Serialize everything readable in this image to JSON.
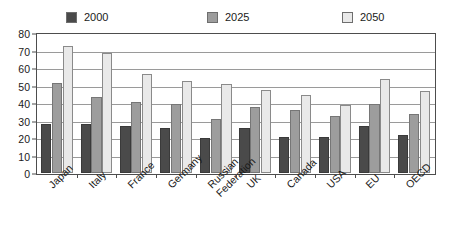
{
  "chart_data": {
    "type": "bar",
    "title": "",
    "subtitle": "",
    "xlabel": "",
    "ylabel": "",
    "ylim": [
      0,
      80
    ],
    "ytick_step": 10,
    "yticks": [
      80,
      70,
      60,
      50,
      40,
      30,
      20,
      10,
      0
    ],
    "grid": true,
    "grid_axis": "y",
    "legend_position": "top",
    "categories": [
      "Japan",
      "Italy",
      "France",
      "Germany",
      "Russian Federation",
      "UK",
      "Canada",
      "USA",
      "EU",
      "OECD"
    ],
    "series": [
      {
        "name": "2000",
        "color": "#4a4a4a",
        "values": [
          28,
          28,
          27,
          26,
          20,
          26,
          21,
          21,
          27,
          22
        ]
      },
      {
        "name": "2025",
        "color": "#9d9d9d",
        "values": [
          52,
          44,
          41,
          40,
          31,
          38,
          36,
          33,
          40,
          34
        ]
      },
      {
        "name": "2050",
        "color": "#e9e9e9",
        "values": [
          73,
          69,
          57,
          53,
          51,
          48,
          45,
          39,
          54,
          47
        ]
      }
    ]
  },
  "legend": {
    "items": [
      {
        "label": "2000",
        "color": "#4a4a4a"
      },
      {
        "label": "2025",
        "color": "#9d9d9d"
      },
      {
        "label": "2050",
        "color": "#e9e9e9"
      }
    ]
  },
  "axes": {
    "y": {
      "ticks": [
        "80",
        "70",
        "60",
        "50",
        "40",
        "30",
        "20",
        "10",
        "0"
      ]
    },
    "x": {
      "ticks": [
        "Japan",
        "Italy",
        "France",
        "Germany",
        "Russian Federation",
        "UK",
        "Canada",
        "USA",
        "EU",
        "OECD"
      ]
    }
  }
}
